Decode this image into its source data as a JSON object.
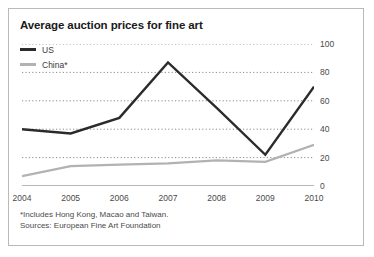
{
  "chart_data": {
    "type": "line",
    "title": "Average auction prices for fine art",
    "xlabel": "",
    "ylabel": "",
    "x": [
      "2004",
      "2005",
      "2006",
      "2007",
      "2008",
      "2009",
      "2010"
    ],
    "categories": [
      "2004",
      "2005",
      "2006",
      "2007",
      "2008",
      "2009",
      "2010"
    ],
    "series": [
      {
        "name": "US",
        "color": "#2b2b2b",
        "values": [
          40,
          37,
          48,
          87,
          55,
          22,
          70
        ]
      },
      {
        "name": "China*",
        "color": "#b2b2b2",
        "values": [
          7,
          14,
          15,
          16,
          18,
          17,
          29
        ]
      }
    ],
    "ylim": [
      0,
      100
    ],
    "yticks": [
      0,
      20,
      40,
      60,
      80,
      100
    ],
    "ytick_labels": [
      "0",
      "20",
      "40",
      "60",
      "80",
      "100"
    ],
    "grid": true,
    "grid_style": "dotted",
    "legend_position": "top-left",
    "annotations": [
      "*Includes Hong Kong, Macao and Taiwan.",
      "Sources: European Fine Art Foundation"
    ]
  },
  "legend": {
    "items": [
      {
        "label": "US",
        "swatch": "us-line-swatch"
      },
      {
        "label": "China*",
        "swatch": "china-line-swatch"
      }
    ]
  },
  "footnotes": {
    "line1": "*Includes Hong Kong, Macao and Taiwan.",
    "line2": "Sources: European Fine Art Foundation"
  }
}
